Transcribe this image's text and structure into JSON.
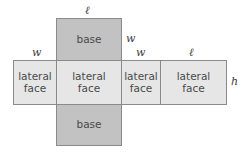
{
  "figure": {
    "background_color": "#ffffff",
    "base_fill": "#c2c2c2",
    "lateral_fill": "#e6e6e6",
    "stroke_color": "#8a8a8a",
    "text_color": "#4a4a4a"
  },
  "faces": {
    "base_top": "base",
    "base_bottom": "base",
    "lateral_1": "lateral\nface",
    "lateral_2": "lateral\nface",
    "lateral_3": "lateral\nface",
    "lateral_4": "lateral\nface"
  },
  "dimension_labels": {
    "l_top": "ℓ",
    "w_left": "w",
    "w_mid": "w",
    "w_right": "w",
    "l_right": "ℓ",
    "h_right": "h"
  }
}
